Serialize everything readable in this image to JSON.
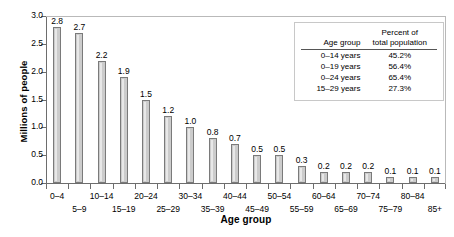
{
  "chart_data": {
    "type": "bar",
    "title": "",
    "xlabel": "Age group",
    "ylabel": "Millions of people",
    "ylim": [
      0.0,
      3.0
    ],
    "ytick_labels": [
      "0.0",
      "0.5",
      "1.0",
      "1.5",
      "2.0",
      "2.5",
      "3.0"
    ],
    "ytick_values": [
      0.0,
      0.5,
      1.0,
      1.5,
      2.0,
      2.5,
      3.0
    ],
    "grid": false,
    "legend_position": "inside-top-right",
    "categories": [
      "0–4",
      "5–9",
      "10–14",
      "15–19",
      "20–24",
      "25–29",
      "30–34",
      "35–39",
      "40–44",
      "45–49",
      "50–54",
      "55–59",
      "60–64",
      "65–69",
      "70–74",
      "75–79",
      "80–84",
      "85+"
    ],
    "values": [
      2.8,
      2.7,
      2.2,
      1.9,
      1.5,
      1.2,
      1.0,
      0.8,
      0.7,
      0.5,
      0.5,
      0.3,
      0.2,
      0.2,
      0.2,
      0.1,
      0.1,
      0.1
    ],
    "data_labels": [
      "2.8",
      "2.7",
      "2.2",
      "1.9",
      "1.5",
      "1.2",
      "1.0",
      "0.8",
      "0.7",
      "0.5",
      "0.5",
      "0.3",
      "0.2",
      "0.2",
      "0.2",
      "0.1",
      "0.1",
      "0.1"
    ],
    "bar_fill_color": "#cccccc",
    "bar_border_color": "#7a7a7a",
    "axis_color": "#6d6d6d"
  },
  "legend": {
    "header_age": "Age group",
    "header_pct_line1": "Percent of",
    "header_pct_line2": "total population",
    "rows": [
      {
        "age": "0–14 years",
        "pct": "45.2%"
      },
      {
        "age": "0–19 years",
        "pct": "56.4%"
      },
      {
        "age": "0–24 years",
        "pct": "65.4%"
      },
      {
        "age": "15–29 years",
        "pct": "27.3%"
      }
    ]
  }
}
